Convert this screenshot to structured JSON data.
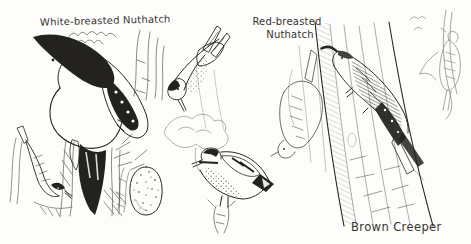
{
  "palette": {
    "paper": "#fdfdfc",
    "ink": "#26251f"
  },
  "labels": {
    "white_breasted_nuthatch": "White-breasted Nuthatch",
    "red_breasted_nuthatch_line1": "Red-breasted",
    "red_breasted_nuthatch_line2": "Nuthatch",
    "brown_creeper": "Brown Creeper"
  },
  "figures": {
    "white_breasted_nuthatch_main": "large black-capped nuthatch climbing head-down on bark",
    "white_breasted_nuthatch_small": "small nuthatch on twig, head down",
    "egg": "speckled nuthatch egg",
    "red_breasted_nuthatch_upper": "outlined nuthatch descending",
    "red_breasted_nuthatch_lower": "red-breasted nuthatch on snag",
    "streaky_bird_study": "light sketch of streaked bird on thin branch",
    "brown_creeper_main": "brown creeper climbing up tree trunk",
    "brown_creeper_small": "faint creeper sketch on branch"
  }
}
